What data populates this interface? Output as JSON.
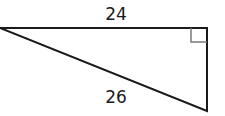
{
  "diagram": {
    "type": "right-triangle",
    "labels": {
      "top_side": "24",
      "hypotenuse": "26"
    },
    "right_angle_marker": true,
    "stroke_color": "#1a1a1a",
    "marker_color": "#7a7a7a"
  }
}
